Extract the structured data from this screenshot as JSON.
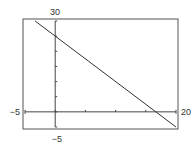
{
  "chart_data": {
    "type": "line",
    "title": "",
    "xlabel": "",
    "ylabel": "",
    "xlim": [
      -5,
      20
    ],
    "ylim": [
      -5,
      30
    ],
    "x_tick_step": 5,
    "y_tick_step": 5,
    "grid": false,
    "series": [
      {
        "name": "y = 25 - 1.5x",
        "x": [
          -3.33,
          0,
          16.67,
          20
        ],
        "y": [
          30,
          25,
          0,
          -5
        ]
      }
    ],
    "labels": {
      "y_max": "30",
      "y_min": "-5",
      "x_min": "-5",
      "x_max": "20"
    }
  },
  "colors": {
    "line": "#333333",
    "frame": "#555555"
  }
}
